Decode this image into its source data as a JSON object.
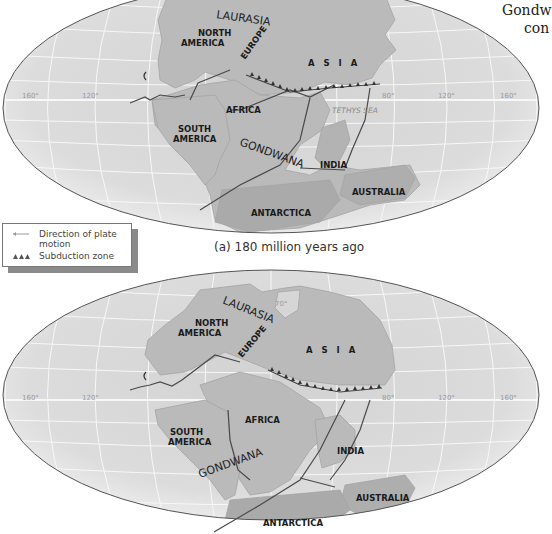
{
  "corner_text": {
    "line1": "Gondw",
    "line2": "con"
  },
  "legend": {
    "items": [
      {
        "symbol": "arrow-icon",
        "label_line1": "Direction of plate",
        "label_line2": "motion"
      },
      {
        "symbol": "subduction-triangles-icon",
        "label_line1": "Subduction zone"
      }
    ]
  },
  "colors": {
    "ocean": "#d9d9d9",
    "ocean_edge": "#f2f2f2",
    "land": "#b9b9b9",
    "grid": "#f5f5f5",
    "outline": "#555555",
    "label": "#1a1a1a"
  },
  "map_a": {
    "caption": "(a) 180 million years ago",
    "supercontinents": [
      "LAURASIA",
      "GONDWANA"
    ],
    "continents": {
      "north_america_1": "NORTH",
      "north_america_2": "AMERICA",
      "europe": "EUROPE",
      "asia": "A S I A",
      "africa": "AFRICA",
      "south_america_1": "SOUTH",
      "south_america_2": "AMERICA",
      "india": "INDIA",
      "australia": "AUSTRALIA",
      "antarctica": "ANTARCTICA"
    },
    "sea_label": "TETHYS SEA",
    "longitude_ticks": [
      "160°",
      "120°",
      "80°",
      "120°",
      "160°"
    ]
  },
  "map_b": {
    "supercontinents": [
      "LAURASIA",
      "GONDWANA"
    ],
    "continents": {
      "north_america_1": "NORTH",
      "north_america_2": "AMERICA",
      "europe": "EUROPE",
      "asia": "A S I A",
      "africa": "AFRICA",
      "south_america_1": "SOUTH",
      "south_america_2": "AMERICA",
      "india": "INDIA",
      "australia": "AUSTRALIA",
      "antarctica": "ANTARCTICA"
    },
    "latitude_tick": "70°",
    "longitude_ticks": [
      "160°",
      "120°",
      "80°",
      "120°",
      "160°"
    ]
  }
}
